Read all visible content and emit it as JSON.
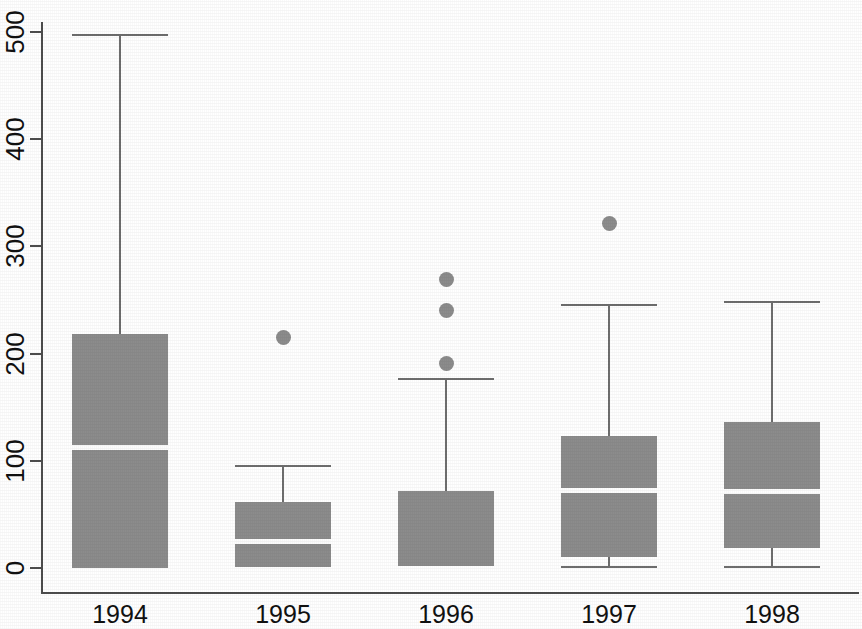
{
  "chart_data": {
    "type": "box",
    "title": "",
    "xlabel": "",
    "ylabel": "",
    "categories": [
      "1994",
      "1995",
      "1996",
      "1997",
      "1998"
    ],
    "ylim": [
      0,
      500
    ],
    "yticks": [
      0,
      100,
      200,
      300,
      400,
      500
    ],
    "ytick_labels": [
      "0",
      "100",
      "200",
      "300",
      "400",
      "500"
    ],
    "grid": false,
    "legend": "none",
    "colors": {
      "box_fill": "#8c8c8c",
      "median_line": "#fdfdfd",
      "whisker": "#6e6e6e",
      "outlier": "#8c8c8c",
      "axis": "#4d4d4d",
      "background": "#ffffff"
    },
    "boxes": [
      {
        "category": "1994",
        "whisker_low": 0,
        "q1": 0,
        "median": 113,
        "q3": 218,
        "whisker_high": 498,
        "outliers": []
      },
      {
        "category": "1995",
        "whisker_low": 1,
        "q1": 1,
        "median": 25,
        "q3": 62,
        "whisker_high": 96,
        "outliers": [
          215
        ]
      },
      {
        "category": "1996",
        "whisker_low": 2,
        "q1": 2,
        "median": 2,
        "q3": 72,
        "whisker_high": 177,
        "outliers": [
          269,
          240,
          191
        ]
      },
      {
        "category": "1997",
        "whisker_low": 2,
        "q1": 10,
        "median": 73,
        "q3": 123,
        "whisker_high": 246,
        "outliers": [
          321
        ]
      },
      {
        "category": "1998",
        "whisker_low": 2,
        "q1": 19,
        "median": 72,
        "q3": 136,
        "whisker_high": 249,
        "outliers": []
      }
    ]
  }
}
